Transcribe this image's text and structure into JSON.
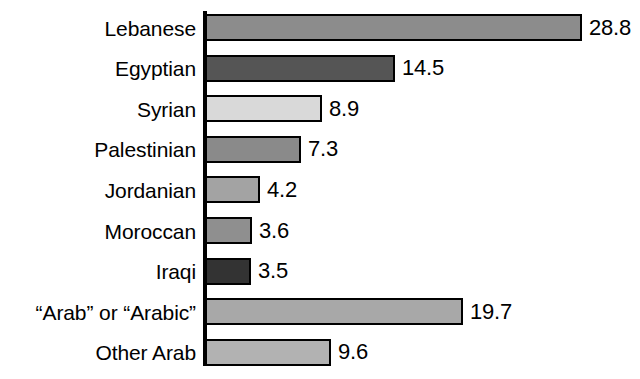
{
  "chart_data": {
    "type": "bar",
    "orientation": "horizontal",
    "title": "",
    "subtitle": "",
    "xlabel": "",
    "ylabel": "",
    "grid": false,
    "legend": null,
    "axis_visible": "category-axis-only",
    "xlim": [
      0,
      28.8
    ],
    "categories": [
      "Lebanese",
      "Egyptian",
      "Syrian",
      "Palestinian",
      "Jordanian",
      "Moroccan",
      "Iraqi",
      "“Arab” or “Arabic”",
      "Other Arab"
    ],
    "values": [
      28.8,
      14.5,
      8.9,
      7.3,
      4.2,
      3.6,
      3.5,
      19.7,
      9.6
    ],
    "value_labels": [
      "28.8",
      "14.5",
      "8.9",
      "7.3",
      "4.2",
      "3.6",
      "3.5",
      "19.7",
      "9.6"
    ],
    "bar_colors": [
      "#8c8c8c",
      "#555555",
      "#d9d9d9",
      "#8a8a8a",
      "#a3a3a3",
      "#8f8f8f",
      "#333333",
      "#a8a8a8",
      "#b2b2b2"
    ],
    "bar_outline_color": "#000000",
    "text_color": "#000000",
    "background_color": "#ffffff"
  }
}
